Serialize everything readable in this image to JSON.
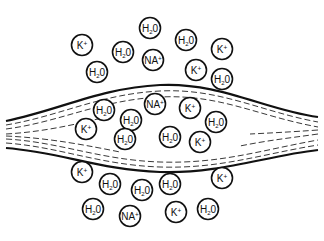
{
  "diagram": {
    "title": "",
    "colors": {
      "stroke": "#111111",
      "background": "#ffffff"
    },
    "membrane": {
      "outer_top": "M 6 121 C 60 110, 100 88, 160 85 C 220 82, 265 110, 318 117",
      "outer_bottom": "M 6 148 C 60 152, 100 170, 160 172 C 220 174, 265 156, 318 150",
      "inner_lines": [
        "M 6 125 C 60 116, 100 94, 160 91 C 220 88, 262 112, 318 122",
        "M 6 129 C 60 122, 100 100, 160 97 C 220 94, 258 116, 318 127",
        "M 6 134 C 40 132, 70 126, 110 116",
        "M 318 130 C 290 132, 270 133, 250 134",
        "M 6 139 C 60 142, 100 160, 160 162 C 220 164, 262 150, 318 140",
        "M 6 143 C 60 147, 100 165, 160 167 C 220 169, 262 154, 318 145",
        "M 6 136 C 50 138, 90 146, 120 152",
        "M 318 134 C 290 138, 270 140, 240 146"
      ]
    },
    "molecules": [
      {
        "label": "H",
        "sub": "2",
        "tail": "0",
        "kind": "water",
        "x": 150,
        "y": 28,
        "region": "outside-top"
      },
      {
        "label": "H",
        "sub": "2",
        "tail": "0",
        "kind": "water",
        "x": 186,
        "y": 40,
        "region": "outside-top"
      },
      {
        "label": "K",
        "sub": "",
        "tail": "+",
        "kind": "potassium",
        "x": 82,
        "y": 45,
        "region": "outside-top"
      },
      {
        "label": "H",
        "sub": "2",
        "tail": "0",
        "kind": "water",
        "x": 123,
        "y": 52,
        "region": "outside-top"
      },
      {
        "label": "NA",
        "sub": "",
        "tail": "+",
        "kind": "sodium",
        "x": 153,
        "y": 60,
        "region": "outside-top"
      },
      {
        "label": "K",
        "sub": "",
        "tail": "+",
        "kind": "potassium",
        "x": 222,
        "y": 49,
        "region": "outside-top"
      },
      {
        "label": "K",
        "sub": "",
        "tail": "+",
        "kind": "potassium",
        "x": 196,
        "y": 70,
        "region": "outside-top"
      },
      {
        "label": "H",
        "sub": "2",
        "tail": "0",
        "kind": "water",
        "x": 97,
        "y": 72,
        "region": "outside-top"
      },
      {
        "label": "H",
        "sub": "2",
        "tail": "0",
        "kind": "water",
        "x": 222,
        "y": 79,
        "region": "outside-top"
      },
      {
        "label": "H",
        "sub": "2",
        "tail": "0",
        "kind": "water",
        "x": 104,
        "y": 110,
        "region": "inside"
      },
      {
        "label": "NA",
        "sub": "",
        "tail": "+",
        "kind": "sodium",
        "x": 155,
        "y": 104,
        "region": "inside"
      },
      {
        "label": "K",
        "sub": "",
        "tail": "+",
        "kind": "potassium",
        "x": 190,
        "y": 108,
        "region": "inside"
      },
      {
        "label": "H",
        "sub": "2",
        "tail": "0",
        "kind": "water",
        "x": 131,
        "y": 120,
        "region": "inside"
      },
      {
        "label": "K",
        "sub": "",
        "tail": "+",
        "kind": "potassium",
        "x": 86,
        "y": 129,
        "region": "inside"
      },
      {
        "label": "H",
        "sub": "2",
        "tail": "0",
        "kind": "water",
        "x": 216,
        "y": 122,
        "region": "inside"
      },
      {
        "label": "H",
        "sub": "2",
        "tail": "0",
        "kind": "water",
        "x": 125,
        "y": 139,
        "region": "inside"
      },
      {
        "label": "H",
        "sub": "2",
        "tail": "0",
        "kind": "water",
        "x": 170,
        "y": 137,
        "region": "inside"
      },
      {
        "label": "K",
        "sub": "",
        "tail": "+",
        "kind": "potassium",
        "x": 200,
        "y": 142,
        "region": "inside"
      },
      {
        "label": "K",
        "sub": "",
        "tail": "+",
        "kind": "potassium",
        "x": 82,
        "y": 172,
        "region": "outside-bottom"
      },
      {
        "label": "H",
        "sub": "2",
        "tail": "0",
        "kind": "water",
        "x": 110,
        "y": 184,
        "region": "outside-bottom"
      },
      {
        "label": "H",
        "sub": "2",
        "tail": "0",
        "kind": "water",
        "x": 142,
        "y": 190,
        "region": "outside-bottom"
      },
      {
        "label": "H",
        "sub": "2",
        "tail": "0",
        "kind": "water",
        "x": 170,
        "y": 184,
        "region": "outside-bottom"
      },
      {
        "label": "K",
        "sub": "",
        "tail": "+",
        "kind": "potassium",
        "x": 222,
        "y": 178,
        "region": "outside-bottom"
      },
      {
        "label": "H",
        "sub": "2",
        "tail": "0",
        "kind": "water",
        "x": 93,
        "y": 209,
        "region": "outside-bottom"
      },
      {
        "label": "NA",
        "sub": "",
        "tail": "+",
        "kind": "sodium",
        "x": 130,
        "y": 216,
        "region": "outside-bottom"
      },
      {
        "label": "K",
        "sub": "",
        "tail": "+",
        "kind": "potassium",
        "x": 176,
        "y": 212,
        "region": "outside-bottom"
      },
      {
        "label": "H",
        "sub": "2",
        "tail": "0",
        "kind": "water",
        "x": 208,
        "y": 209,
        "region": "outside-bottom"
      }
    ],
    "counts": {
      "outside_top": {
        "H2O": 5,
        "K+": 3,
        "NA+": 1
      },
      "inside": {
        "H2O": 5,
        "K+": 3,
        "NA+": 1
      },
      "outside_bottom": {
        "H2O": 5,
        "K+": 3,
        "NA+": 1
      }
    }
  }
}
